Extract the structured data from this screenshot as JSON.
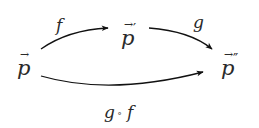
{
  "diagram": {
    "type": "commutative-diagram",
    "nodes": [
      {
        "id": "p",
        "symbol": "p",
        "vector_mark": "→",
        "primes": ""
      },
      {
        "id": "p1",
        "symbol": "p",
        "vector_mark": "→",
        "primes": "′"
      },
      {
        "id": "p2",
        "symbol": "p",
        "vector_mark": "→",
        "primes": "″"
      }
    ],
    "arrows": [
      {
        "from": "p",
        "to": "p1",
        "label": "f"
      },
      {
        "from": "p1",
        "to": "p2",
        "label": "g"
      },
      {
        "from": "p",
        "to": "p2",
        "label_left": "g",
        "compose": "∘",
        "label_right": "f"
      }
    ],
    "colors": {
      "ink": "#2a2a2a",
      "background": "#ffffff"
    }
  }
}
